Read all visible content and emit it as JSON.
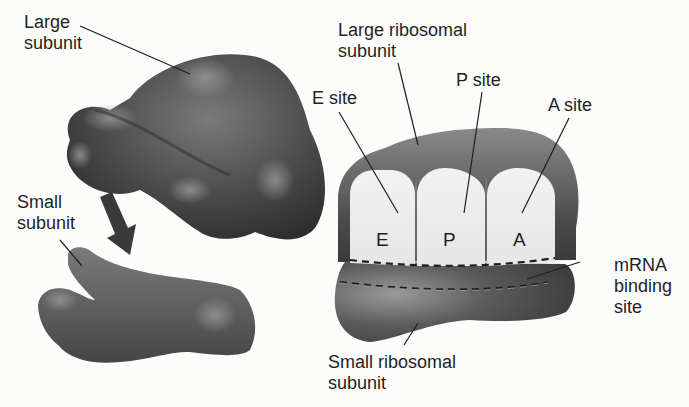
{
  "left_panel": {
    "large_subunit_label": [
      "Large",
      "subunit"
    ],
    "small_subunit_label": [
      "Small",
      "subunit"
    ],
    "arrow": "down-right assembly arrow"
  },
  "right_panel": {
    "large_ribosomal_label": [
      "Large ribosomal",
      "subunit"
    ],
    "small_ribosomal_label": [
      "Small ribosomal",
      "subunit"
    ],
    "e_site_label": "E site",
    "p_site_label": "P site",
    "a_site_label": "A site",
    "mrna_label": [
      "mRNA",
      "binding",
      "site"
    ],
    "sites": [
      "E",
      "P",
      "A"
    ]
  },
  "colors": {
    "background": "#fcfcfb",
    "subunit_dark": "#3a3a3a",
    "subunit_mid": "#6a6a6a",
    "site_fill": "#ececec",
    "text": "#1f1f1f"
  }
}
